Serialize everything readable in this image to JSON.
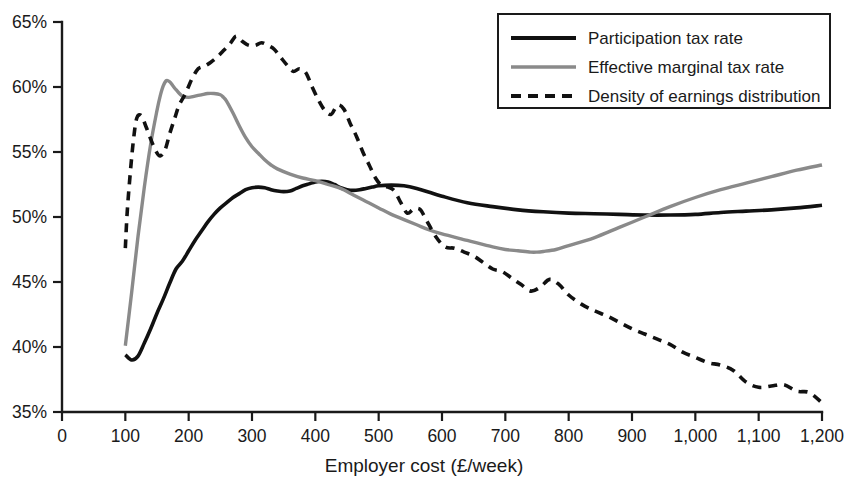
{
  "chart_data": {
    "type": "line",
    "title": "",
    "xlabel": "Employer cost (£/week)",
    "ylabel": "",
    "xlim": [
      0,
      1200
    ],
    "ylim": [
      35,
      65
    ],
    "xticks": [
      0,
      100,
      200,
      300,
      400,
      500,
      600,
      700,
      800,
      900,
      1000,
      1100,
      1200
    ],
    "xticklabels": [
      "0",
      "100",
      "200",
      "300",
      "400",
      "500",
      "600",
      "700",
      "800",
      "900",
      "1,000",
      "1,100",
      "1,200"
    ],
    "yticks": [
      35,
      40,
      45,
      50,
      55,
      60,
      65
    ],
    "yticklabels": [
      "35%",
      "40%",
      "45%",
      "50%",
      "55%",
      "60%",
      "65%"
    ],
    "grid": false,
    "legend_position": "top-right",
    "series": [
      {
        "name": "Participation tax rate",
        "style": "solid",
        "color": "#111111",
        "width": 3.6,
        "x": [
          100,
          110,
          120,
          130,
          140,
          150,
          160,
          170,
          180,
          190,
          200,
          210,
          220,
          230,
          240,
          250,
          260,
          270,
          280,
          290,
          300,
          310,
          320,
          330,
          340,
          350,
          360,
          370,
          380,
          390,
          400,
          410,
          420,
          430,
          440,
          450,
          460,
          470,
          480,
          490,
          500,
          520,
          540,
          560,
          580,
          600,
          640,
          680,
          720,
          760,
          800,
          840,
          880,
          920,
          960,
          1000,
          1040,
          1080,
          1120,
          1160,
          1200
        ],
        "y": [
          39.4,
          39.0,
          39.3,
          40.3,
          41.4,
          42.6,
          43.7,
          44.9,
          46.0,
          46.6,
          47.4,
          48.2,
          48.9,
          49.6,
          50.2,
          50.7,
          51.1,
          51.5,
          51.8,
          52.1,
          52.25,
          52.3,
          52.25,
          52.1,
          52.0,
          51.95,
          52.0,
          52.2,
          52.4,
          52.55,
          52.7,
          52.75,
          52.7,
          52.5,
          52.25,
          52.1,
          52.05,
          52.1,
          52.2,
          52.3,
          52.4,
          52.45,
          52.4,
          52.2,
          51.9,
          51.6,
          51.1,
          50.8,
          50.55,
          50.4,
          50.3,
          50.25,
          50.2,
          50.15,
          50.15,
          50.2,
          50.35,
          50.45,
          50.55,
          50.7,
          50.9
        ]
      },
      {
        "name": "Effective marginal tax rate",
        "style": "solid",
        "color": "#8a8a8a",
        "width": 3.4,
        "x": [
          100,
          110,
          120,
          130,
          140,
          150,
          155,
          160,
          165,
          170,
          175,
          180,
          190,
          200,
          210,
          220,
          230,
          240,
          250,
          255,
          260,
          270,
          280,
          290,
          300,
          310,
          320,
          330,
          340,
          360,
          380,
          400,
          420,
          440,
          460,
          480,
          500,
          520,
          540,
          560,
          580,
          600,
          640,
          680,
          700,
          720,
          740,
          750,
          760,
          780,
          800,
          840,
          880,
          920,
          960,
          1000,
          1040,
          1080,
          1120,
          1160,
          1200
        ],
        "y": [
          40.1,
          44.2,
          48.5,
          52.3,
          55.6,
          58.2,
          59.3,
          60.1,
          60.5,
          60.4,
          60.1,
          59.8,
          59.3,
          59.2,
          59.3,
          59.4,
          59.5,
          59.5,
          59.4,
          59.2,
          58.9,
          58.0,
          57.0,
          56.1,
          55.4,
          54.9,
          54.4,
          54.0,
          53.7,
          53.3,
          53.0,
          52.8,
          52.5,
          52.2,
          51.7,
          51.2,
          50.7,
          50.2,
          49.8,
          49.4,
          49.0,
          48.7,
          48.2,
          47.7,
          47.5,
          47.4,
          47.3,
          47.3,
          47.35,
          47.5,
          47.8,
          48.4,
          49.2,
          50.0,
          50.8,
          51.5,
          52.1,
          52.6,
          53.1,
          53.6,
          54.0
        ]
      },
      {
        "name": "Density of earnings distribution",
        "style": "dashed",
        "color": "#111111",
        "width": 3.6,
        "x": [
          100,
          103,
          108,
          113,
          118,
          125,
          133,
          140,
          148,
          155,
          163,
          170,
          178,
          185,
          195,
          205,
          215,
          225,
          235,
          245,
          255,
          265,
          275,
          285,
          295,
          305,
          315,
          325,
          335,
          345,
          355,
          365,
          375,
          385,
          395,
          405,
          415,
          425,
          435,
          445,
          455,
          465,
          475,
          485,
          495,
          505,
          515,
          525,
          535,
          545,
          555,
          565,
          575,
          590,
          605,
          620,
          635,
          650,
          665,
          680,
          695,
          710,
          725,
          740,
          755,
          770,
          785,
          800,
          820,
          840,
          860,
          880,
          900,
          920,
          940,
          960,
          980,
          1000,
          1020,
          1040,
          1060,
          1080,
          1100,
          1120,
          1140,
          1160,
          1180,
          1200
        ],
        "y": [
          47.6,
          50.4,
          53.5,
          56.0,
          57.6,
          57.8,
          56.9,
          56.0,
          55.1,
          54.7,
          55.2,
          56.4,
          57.6,
          58.6,
          59.5,
          60.6,
          61.4,
          61.6,
          61.9,
          62.3,
          62.8,
          63.3,
          63.9,
          63.5,
          63.2,
          63.2,
          63.4,
          63.2,
          62.9,
          62.3,
          61.7,
          61.2,
          61.4,
          61.1,
          60.0,
          59.0,
          58.2,
          57.9,
          58.6,
          58.3,
          57.2,
          56.2,
          55.0,
          54.0,
          53.0,
          52.4,
          52.3,
          52.0,
          51.1,
          50.3,
          50.6,
          50.6,
          49.8,
          48.5,
          47.7,
          47.6,
          47.3,
          47.0,
          46.5,
          46.0,
          45.8,
          45.3,
          44.8,
          44.3,
          44.6,
          45.2,
          44.8,
          44.0,
          43.3,
          42.8,
          42.4,
          41.9,
          41.4,
          41.0,
          40.6,
          40.2,
          39.6,
          39.2,
          38.8,
          38.6,
          38.2,
          37.3,
          36.9,
          37.0,
          37.1,
          36.6,
          36.5,
          35.7
        ]
      }
    ],
    "legend": [
      {
        "label": "Participation tax rate",
        "style": "solid",
        "color": "#111111"
      },
      {
        "label": "Effective marginal tax rate",
        "style": "solid",
        "color": "#8a8a8a"
      },
      {
        "label": "Density of earnings distribution",
        "style": "dashed",
        "color": "#111111"
      }
    ]
  }
}
